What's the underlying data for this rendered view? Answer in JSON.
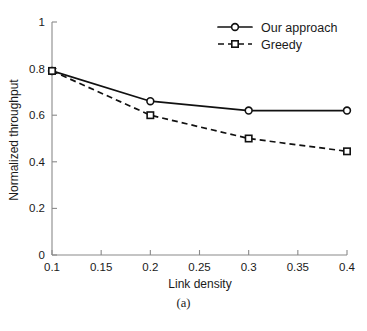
{
  "chart_data": {
    "type": "line",
    "title": "",
    "xlabel": "Link density",
    "ylabel": "Normalized throughput",
    "x": [
      0.1,
      0.2,
      0.3,
      0.4
    ],
    "xlim": [
      0.1,
      0.4
    ],
    "ylim": [
      0,
      1
    ],
    "xticks": [
      0.1,
      0.15,
      0.2,
      0.25,
      0.3,
      0.35,
      0.4
    ],
    "xtick_labels": [
      "0.1",
      "0.15",
      "0.2",
      "0.25",
      "0.3",
      "0.35",
      "0.4"
    ],
    "yticks": [
      0,
      0.2,
      0.4,
      0.6,
      0.8,
      1
    ],
    "ytick_labels": [
      "0",
      "0.2",
      "0.4",
      "0.6",
      "0.8",
      "1"
    ],
    "grid": false,
    "legend_position": "top-right",
    "series": [
      {
        "name": "Our approach",
        "values": [
          0.79,
          0.66,
          0.62,
          0.62
        ],
        "style": "solid",
        "marker": "circle",
        "color": "#111111"
      },
      {
        "name": "Greedy",
        "values": [
          0.79,
          0.6,
          0.5,
          0.445
        ],
        "style": "dashed",
        "marker": "square",
        "color": "#111111"
      }
    ]
  },
  "caption": {
    "text": "(a)"
  },
  "legend": {
    "entries": [
      {
        "label": "Our approach"
      },
      {
        "label": "Greedy"
      }
    ]
  }
}
